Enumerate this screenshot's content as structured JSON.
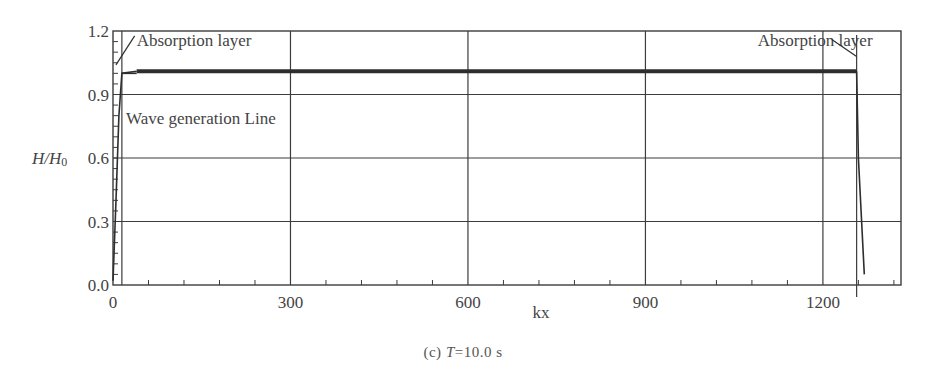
{
  "chart_data": {
    "type": "line",
    "title": "",
    "caption": "(c) T=10.0 s",
    "caption_parts": {
      "prefix": "(c) ",
      "var": "T",
      "rest": "=10.0 s"
    },
    "xlabel": "kx",
    "ylabel": "H/H0",
    "ylabel_parts": {
      "a": "H/H",
      "sub": "0"
    },
    "xlim": [
      0,
      1332
    ],
    "ylim": [
      0.0,
      1.2
    ],
    "xticks": [
      0,
      300,
      600,
      900,
      1200
    ],
    "xtick_labels": [
      "0",
      "300",
      "600",
      "900",
      "1200"
    ],
    "yticks": [
      0.0,
      0.3,
      0.6,
      0.9,
      1.2
    ],
    "ytick_labels": [
      "0.0",
      "0.3",
      "0.6",
      "0.9",
      "1.2"
    ],
    "grid": true,
    "extra_vertical_lines": [
      {
        "x": 15,
        "meaning": "wave generation line"
      },
      {
        "x": 1257,
        "meaning": "absorption layer boundary"
      }
    ],
    "series": [
      {
        "name": "H/H0",
        "x": [
          0,
          5,
          10,
          15,
          40,
          300,
          600,
          900,
          1200,
          1257,
          1260,
          1270
        ],
        "y": [
          0.02,
          0.4,
          0.8,
          1.0,
          1.01,
          1.01,
          1.01,
          1.01,
          1.01,
          1.01,
          0.6,
          0.05
        ]
      }
    ],
    "annotations": [
      {
        "text": "Absorption layer",
        "x": 40,
        "y": 1.13,
        "arrow_to": [
          5,
          1.04
        ]
      },
      {
        "text": "Absorption layer",
        "x": 1090,
        "y": 1.13,
        "arrow_to": [
          1257,
          1.08
        ]
      },
      {
        "text": "Wave generation Line",
        "x": 22,
        "y": 0.76
      }
    ],
    "legend": null
  },
  "colors": {
    "axis": "#3c3c3c",
    "grid": "#3c3c3c",
    "line": "#2e2e2e",
    "text": "#444444"
  }
}
